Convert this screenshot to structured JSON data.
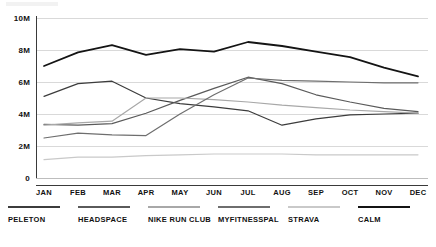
{
  "chart_data": {
    "type": "line",
    "title": "",
    "xlabel": "",
    "ylabel": "",
    "ylim": [
      0,
      10000000
    ],
    "grid": true,
    "legend_position": "bottom",
    "categories": [
      "JAN",
      "FEB",
      "MAR",
      "APR",
      "MAY",
      "JUN",
      "JUL",
      "AUG",
      "SEP",
      "OCT",
      "NOV",
      "DEC"
    ],
    "ytick_labels": [
      "10M",
      "8M",
      "6M",
      "4M",
      "2M",
      "0"
    ],
    "ytick_values": [
      10000000,
      8000000,
      6000000,
      4000000,
      2000000,
      0
    ],
    "series": [
      {
        "name": "PELETON",
        "color": "#3c3c3c",
        "values": [
          5100000,
          5900000,
          6050000,
          5000000,
          4650000,
          4450000,
          4200000,
          3300000,
          3700000,
          3950000,
          4000000,
          4050000
        ]
      },
      {
        "name": "HEADSPACE",
        "color": "#5a5a5a",
        "values": [
          3350000,
          3300000,
          3400000,
          4050000,
          4850000,
          5600000,
          6300000,
          5900000,
          5200000,
          4750000,
          4350000,
          4150000
        ]
      },
      {
        "name": "NIKE RUN CLUB",
        "color": "#a8a8a8",
        "values": [
          3300000,
          3450000,
          3550000,
          5000000,
          5000000,
          4900000,
          4750000,
          4550000,
          4400000,
          4250000,
          4150000,
          4050000
        ]
      },
      {
        "name": "MYFITNESSPAL",
        "color": "#6e6e6e",
        "values": [
          2500000,
          2800000,
          2700000,
          2650000,
          4000000,
          5200000,
          6250000,
          6100000,
          6050000,
          6000000,
          5950000,
          5950000
        ]
      },
      {
        "name": "STRAVA",
        "color": "#c9c9c9",
        "values": [
          1150000,
          1300000,
          1300000,
          1400000,
          1450000,
          1500000,
          1500000,
          1500000,
          1450000,
          1450000,
          1450000,
          1450000
        ]
      },
      {
        "name": "CALM",
        "color": "#141414",
        "values": [
          7000000,
          7850000,
          8300000,
          7700000,
          8050000,
          7900000,
          8500000,
          8250000,
          7900000,
          7550000,
          6900000,
          6350000
        ]
      }
    ]
  },
  "legend": {
    "items": [
      {
        "label": "PELETON",
        "color": "#3c3c3c"
      },
      {
        "label": "HEADSPACE",
        "color": "#5a5a5a"
      },
      {
        "label": "NIKE RUN CLUB",
        "color": "#a8a8a8"
      },
      {
        "label": "MYFITNESSPAL",
        "color": "#6e6e6e"
      },
      {
        "label": "STRAVA",
        "color": "#c9c9c9"
      },
      {
        "label": "CALM",
        "color": "#141414"
      }
    ]
  }
}
